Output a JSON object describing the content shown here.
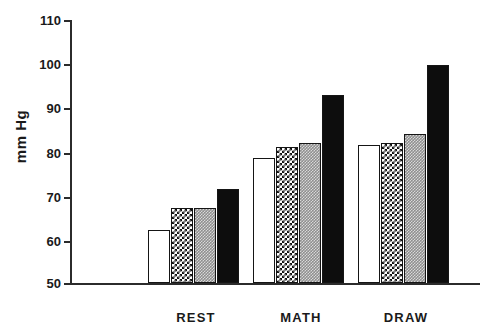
{
  "chart_data": {
    "type": "bar",
    "title": "",
    "xlabel": "",
    "ylabel": "mm Hg",
    "ylim": [
      50,
      110
    ],
    "ytick_labels": [
      "110",
      "100",
      "90",
      "80",
      "70",
      "60",
      "50"
    ],
    "yticks": [
      110,
      100,
      90,
      80,
      70,
      60,
      50
    ],
    "grid": false,
    "legend": "none",
    "categories": [
      "REST",
      "MATH",
      "DRAW"
    ],
    "series": [
      {
        "name": "open",
        "pattern": "white-open",
        "values": [
          62,
          78.5,
          81.5
        ]
      },
      {
        "name": "checkered",
        "pattern": "black-white-checker",
        "values": [
          67,
          81,
          82
        ]
      },
      {
        "name": "gray",
        "pattern": "gray-stipple",
        "values": [
          67,
          82,
          84
        ]
      },
      {
        "name": "solid",
        "pattern": "solid-black",
        "values": [
          71.5,
          93,
          99.8
        ]
      }
    ]
  },
  "axis": {
    "y_label": "mm Hg",
    "tick_110": "110",
    "tick_100": "100",
    "tick_90": "90",
    "tick_80": "80",
    "tick_70": "70",
    "tick_60": "60",
    "tick_50": "50"
  },
  "categories": {
    "rest": "REST",
    "math": "MATH",
    "draw": "DRAW"
  }
}
